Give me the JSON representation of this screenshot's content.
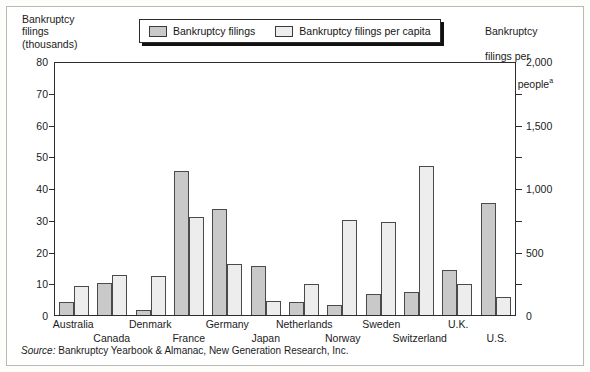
{
  "left_axis": {
    "title": "Bankruptcy\nfilings\n(thousands)",
    "ticks": [
      "80",
      "70",
      "60",
      "50",
      "40",
      "30",
      "20",
      "10",
      "0"
    ],
    "min": 0,
    "max": 80
  },
  "right_axis": {
    "title_line1": "Bankruptcy",
    "title_line2": "filings per",
    "title_line3": "million people",
    "title_superscript": "a",
    "ticks": [
      "2,000",
      "1,500",
      "1,000",
      "500",
      "0"
    ],
    "min": 0,
    "max": 2000
  },
  "legend": {
    "items": [
      {
        "label": "Bankruptcy filings",
        "color": "#c9c9c9"
      },
      {
        "label": "Bankruptcy filings per capita",
        "color": "#ededed"
      }
    ]
  },
  "source": {
    "prefix": "Source:",
    "text": "Bankruptcy Yearbook & Almanac, New Generation Research, Inc."
  },
  "chart_data": {
    "type": "bar",
    "title": "",
    "xlabel": "",
    "ylabel": "Bankruptcy filings (thousands)",
    "ylabel_right": "Bankruptcy filings per million people",
    "ylim": [
      0,
      80
    ],
    "ylim_right": [
      0,
      2000
    ],
    "grid": false,
    "legend_position": "top-center",
    "categories": [
      "Australia",
      "Canada",
      "Denmark",
      "France",
      "Germany",
      "Japan",
      "Netherlands",
      "Norway",
      "Sweden",
      "Switzerland",
      "U.K.",
      "U.S."
    ],
    "series": [
      {
        "name": "Bankruptcy filings",
        "axis": "left",
        "units": "thousands",
        "color": "#c9c9c9",
        "values": [
          4.2,
          10.2,
          1.7,
          45.5,
          33.5,
          15.3,
          4.0,
          3.3,
          6.7,
          7.3,
          14.2,
          35.4
        ]
      },
      {
        "name": "Bankruptcy filings per capita",
        "axis": "right",
        "units": "per million people",
        "color": "#ededed",
        "values": [
          225,
          318,
          305,
          775,
          400,
          113,
          245,
          750,
          733,
          1175,
          245,
          138
        ]
      }
    ]
  }
}
